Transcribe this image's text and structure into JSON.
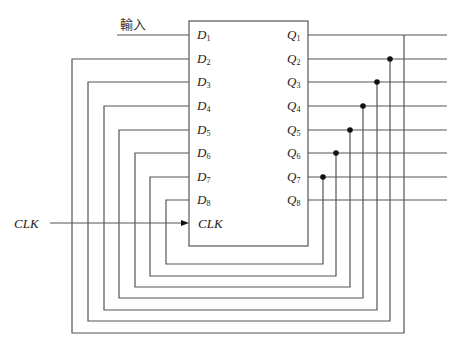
{
  "diagram": {
    "type": "shift-register-feedback",
    "input_label": "輸入",
    "clock_label": "CLK",
    "block_clock_pin": "CLK",
    "inputs": [
      {
        "name": "D",
        "sub": "1"
      },
      {
        "name": "D",
        "sub": "2"
      },
      {
        "name": "D",
        "sub": "3"
      },
      {
        "name": "D",
        "sub": "4"
      },
      {
        "name": "D",
        "sub": "5"
      },
      {
        "name": "D",
        "sub": "6"
      },
      {
        "name": "D",
        "sub": "7"
      },
      {
        "name": "D",
        "sub": "8"
      }
    ],
    "outputs": [
      {
        "name": "Q",
        "sub": "1"
      },
      {
        "name": "Q",
        "sub": "2"
      },
      {
        "name": "Q",
        "sub": "3"
      },
      {
        "name": "Q",
        "sub": "4"
      },
      {
        "name": "Q",
        "sub": "5"
      },
      {
        "name": "Q",
        "sub": "6"
      },
      {
        "name": "Q",
        "sub": "7"
      },
      {
        "name": "Q",
        "sub": "8"
      }
    ],
    "connections": [
      "Q1→D2",
      "Q2→D3",
      "Q3→D4",
      "Q4→D5",
      "Q5→D6",
      "Q6→D7",
      "Q7→D8"
    ],
    "colors": {
      "line": "#555555",
      "text": "#222222",
      "dot": "#111111"
    }
  }
}
